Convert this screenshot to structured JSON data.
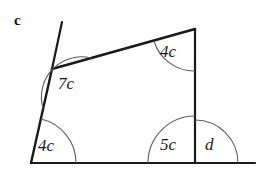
{
  "figure": {
    "part_label": "c",
    "background_color": "#ffffff",
    "line_color": "#1a1a1a",
    "arc_color": "#5d5d5d",
    "shape": "quadrilateral-with-extended-rays",
    "vertices": {
      "top_left": [
        52,
        69
      ],
      "top_right": [
        195,
        29
      ],
      "bottom_right": [
        195,
        163
      ],
      "bottom_left": [
        31,
        163
      ]
    },
    "segments": [
      {
        "name": "left-edge-ray-extension",
        "from": [
          62,
          22
        ],
        "to": [
          52,
          69
        ],
        "width": 2.2
      },
      {
        "name": "left-edge",
        "from": [
          52,
          69
        ],
        "to": [
          31,
          163
        ],
        "width": 2.4
      },
      {
        "name": "top-edge",
        "from": [
          52,
          69
        ],
        "to": [
          195,
          29
        ],
        "width": 2.6
      },
      {
        "name": "right-edge",
        "from": [
          195,
          29
        ],
        "to": [
          195,
          163
        ],
        "width": 2.2
      },
      {
        "name": "bottom-edge",
        "from": [
          31,
          163
        ],
        "to": [
          255,
          163
        ],
        "width": 2.2
      }
    ],
    "angles": [
      {
        "name": "angle-7c",
        "label": "7c",
        "coefficient": 7,
        "variable": "c",
        "vertex": "top_left",
        "label_pos": [
          58,
          75
        ],
        "arc_radius": 40
      },
      {
        "name": "angle-4c-top-right",
        "label": "4c",
        "coefficient": 4,
        "variable": "c",
        "vertex": "top_right",
        "label_pos": [
          160,
          43
        ],
        "arc_radius": 42
      },
      {
        "name": "angle-4c-bottom-left",
        "label": "4c",
        "coefficient": 4,
        "variable": "c",
        "vertex": "bottom_left",
        "label_pos": [
          38,
          137
        ],
        "arc_radius": 45
      },
      {
        "name": "angle-5c",
        "label": "5c",
        "coefficient": 5,
        "variable": "c",
        "vertex": "bottom_right",
        "label_pos": [
          160,
          136
        ],
        "arc_radius": 47
      },
      {
        "name": "angle-d",
        "label": "d",
        "variable": "d",
        "vertex": "bottom_right",
        "label_pos": [
          205,
          136
        ],
        "arc_radius": 43
      }
    ]
  }
}
